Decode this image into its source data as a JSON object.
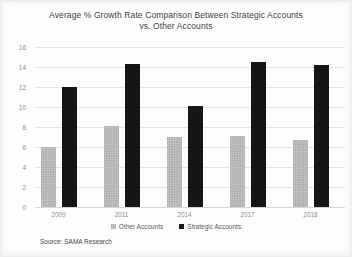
{
  "page": {
    "background": "#fdfdfd"
  },
  "chart_data": {
    "type": "bar",
    "title": "Average % Growth Rate Comparison Between Strategic Accounts vs. Other Accounts",
    "title_line1": "Average % Growth Rate Comparison Between Strategic Accounts",
    "title_line2": "vs. Other Accounts",
    "categories": [
      "2009",
      "2011",
      "2014",
      "2017",
      "2018"
    ],
    "series": [
      {
        "name": "Other Accounts",
        "color": "#b4b4b4",
        "pattern": "dotted",
        "values": [
          6,
          8.1,
          7,
          7.1,
          6.7
        ]
      },
      {
        "name": "Strategic Accounts",
        "color": "#161616",
        "pattern": "solid",
        "values": [
          12,
          14.3,
          10.1,
          14.5,
          14.2
        ]
      }
    ],
    "ylim": [
      0,
      16
    ],
    "ytick_step": 2,
    "grid": true,
    "gridline_color": "#e4e4e4",
    "legend_position": "bottom",
    "xlabel": "",
    "ylabel": ""
  },
  "source_note": "Source: SAMA Research"
}
